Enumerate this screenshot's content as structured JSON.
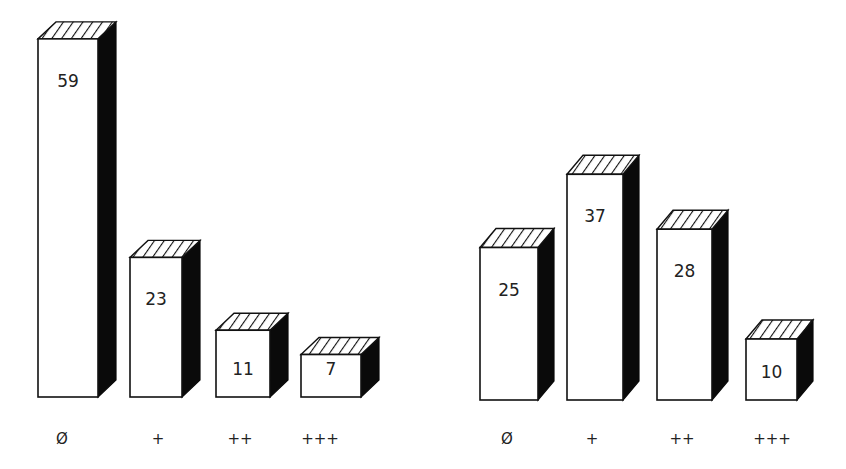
{
  "chart_data": [
    {
      "type": "bar",
      "style": "3d-hatched",
      "title": "",
      "xlabel": "",
      "ylabel": "",
      "categories": [
        "Ø",
        "+",
        "++",
        "+++"
      ],
      "values": [
        59,
        23,
        11,
        7
      ],
      "value_labels": [
        "59",
        "23",
        "11",
        "7"
      ],
      "grid": false,
      "legend": "none"
    },
    {
      "type": "bar",
      "style": "3d-hatched",
      "title": "",
      "xlabel": "",
      "ylabel": "",
      "categories": [
        "Ø",
        "+",
        "++",
        "+++"
      ],
      "values": [
        25,
        37,
        28,
        10
      ],
      "value_labels": [
        "25",
        "37",
        "28",
        "10"
      ],
      "grid": false,
      "legend": "none"
    }
  ],
  "colors": {
    "front": "#ffffff",
    "side": "#0a0a0a",
    "outline": "#111111",
    "text": "#222222"
  }
}
